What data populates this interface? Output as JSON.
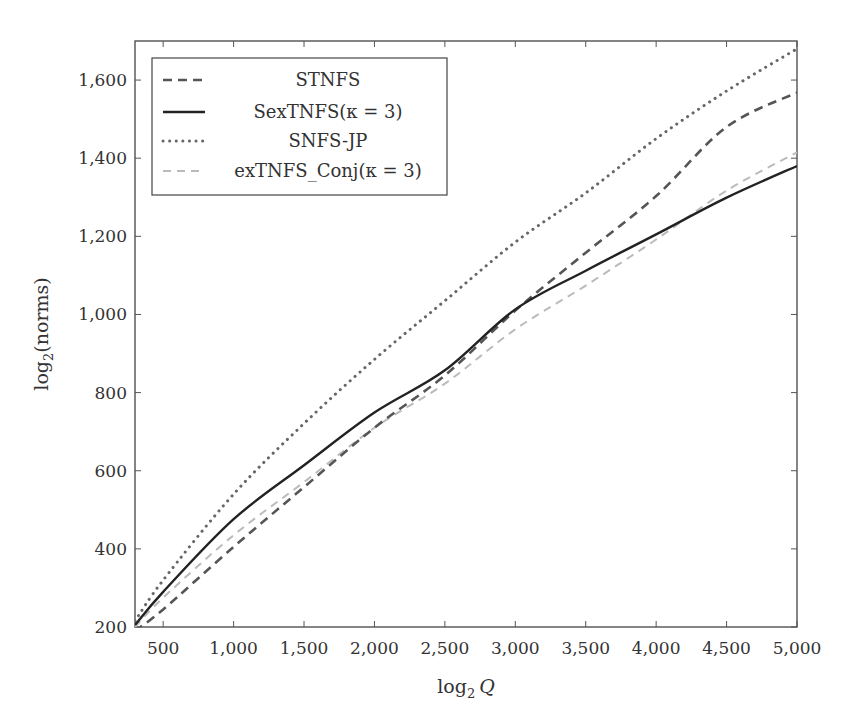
{
  "chart_data": {
    "type": "line",
    "title": "",
    "xlabel": "log2 Q",
    "ylabel": "log2(norms)",
    "xlim": [
      300,
      5000
    ],
    "ylim": [
      200,
      1700
    ],
    "xticks": [
      500,
      1000,
      1500,
      2000,
      2500,
      3000,
      3500,
      4000,
      4500,
      5000
    ],
    "xtick_labels": [
      "500",
      "1,000",
      "1,500",
      "2,000",
      "2,500",
      "3,000",
      "3,500",
      "4,000",
      "4,500",
      "5,000"
    ],
    "yticks": [
      200,
      400,
      600,
      800,
      1000,
      1200,
      1400,
      1600
    ],
    "ytick_labels": [
      "200",
      "400",
      "600",
      "800",
      "1,000",
      "1,200",
      "1,400",
      "1,600"
    ],
    "grid": false,
    "legend_position": "upper left",
    "x": [
      300,
      500,
      1000,
      1500,
      2000,
      2500,
      3000,
      3500,
      4000,
      4500,
      5000
    ],
    "series": [
      {
        "name": "STNFS",
        "style": "dashed",
        "color": "#555555",
        "values": [
          190,
          245,
          405,
          558,
          710,
          844,
          1010,
          1158,
          1303,
          1480,
          1568
        ]
      },
      {
        "name": "SexTNFS(κ = 3)",
        "style": "solid",
        "color": "#222222",
        "values": [
          205,
          290,
          476,
          614,
          749,
          857,
          1013,
          1112,
          1205,
          1299,
          1380
        ]
      },
      {
        "name": "SNFS-JP",
        "style": "dotted",
        "color": "#666666",
        "values": [
          215,
          320,
          540,
          721,
          885,
          1035,
          1185,
          1311,
          1450,
          1572,
          1680
        ]
      },
      {
        "name": "exTNFS_Conj(κ = 3)",
        "style": "dashed-light",
        "color": "#bbbbbb",
        "values": [
          200,
          275,
          435,
          571,
          710,
          823,
          962,
          1074,
          1192,
          1317,
          1415
        ]
      }
    ]
  },
  "axes": {
    "x_label_main": "log",
    "x_label_sub": "2",
    "x_label_var": "Q",
    "y_label_main": "log",
    "y_label_sub": "2",
    "y_label_rest": "(norms)"
  },
  "legend": {
    "entries": [
      {
        "label": "STNFS"
      },
      {
        "label": "SexTNFS(κ = 3)"
      },
      {
        "label": "SNFS-JP"
      },
      {
        "label": "exTNFS_Conj(κ = 3)"
      }
    ]
  }
}
